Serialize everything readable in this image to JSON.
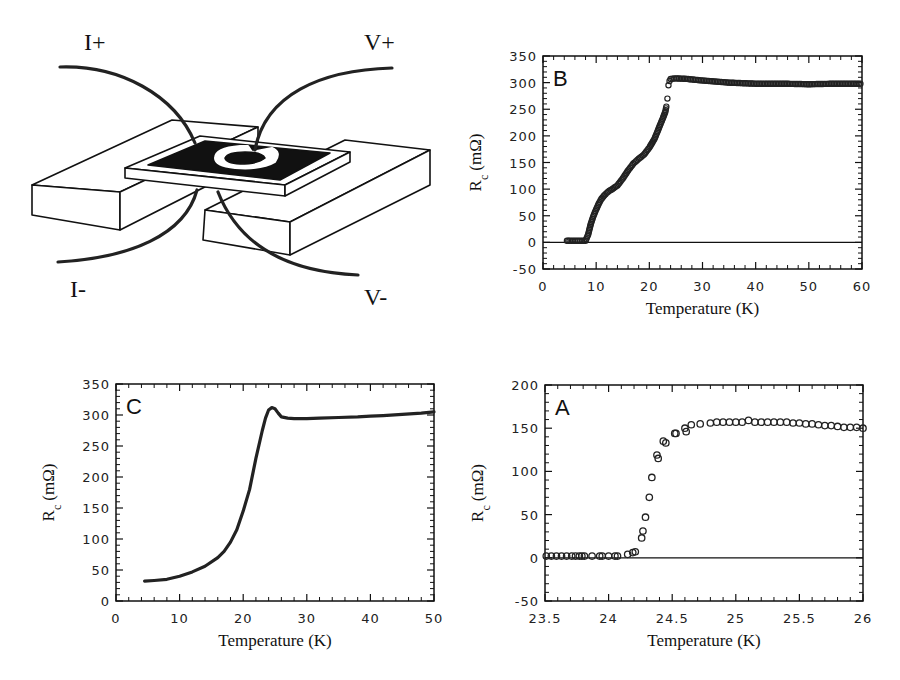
{
  "diagram": {
    "labels": {
      "i_plus": "I+",
      "v_plus": "V+",
      "i_minus": "I-",
      "v_minus": "V-"
    }
  },
  "chart_data": [
    {
      "id": "B",
      "type": "scatter",
      "panel_label": "B",
      "xlabel": "Temperature (K)",
      "ylabel": "R_c (mΩ)",
      "xlim": [
        0,
        60
      ],
      "ylim": [
        -50,
        350
      ],
      "xticks": [
        0,
        10,
        20,
        30,
        40,
        50,
        60
      ],
      "yticks": [
        -50,
        0,
        50,
        100,
        150,
        200,
        250,
        300,
        350
      ],
      "zero_line": true,
      "marker": "open-circle",
      "x": [
        4.5,
        5,
        6,
        7,
        8,
        8.5,
        9,
        9.5,
        10,
        10.5,
        11,
        11.5,
        12,
        12.5,
        13,
        14,
        15,
        16,
        17,
        18,
        19,
        20,
        21,
        22,
        22.5,
        23,
        23.2,
        23.4,
        23.6,
        23.8,
        24,
        25,
        27,
        30,
        35,
        40,
        45,
        50,
        55,
        60
      ],
      "y": [
        3,
        3,
        3,
        3,
        3,
        15,
        35,
        50,
        62,
        73,
        82,
        88,
        93,
        97,
        100,
        107,
        120,
        135,
        148,
        157,
        165,
        178,
        195,
        220,
        232,
        245,
        255,
        270,
        295,
        303,
        307,
        308,
        307,
        304,
        300,
        298,
        298,
        297,
        298,
        298
      ]
    },
    {
      "id": "C",
      "type": "line",
      "panel_label": "C",
      "xlabel": "Temperature (K)",
      "ylabel": "R_c (mΩ)",
      "xlim": [
        0,
        50
      ],
      "ylim": [
        0,
        350
      ],
      "xticks": [
        0,
        10,
        20,
        30,
        40,
        50
      ],
      "yticks": [
        0,
        50,
        100,
        150,
        200,
        250,
        300,
        350
      ],
      "zero_line": false,
      "marker": "dense-line",
      "x": [
        4.5,
        6,
        8,
        10,
        12,
        14,
        16,
        17,
        18,
        19,
        20,
        21,
        22,
        23,
        23.5,
        24,
        24.5,
        25,
        25.5,
        26,
        27,
        28,
        30,
        32,
        35,
        38,
        40,
        42,
        45,
        48,
        50
      ],
      "y": [
        32,
        33,
        35,
        40,
        47,
        56,
        70,
        80,
        95,
        115,
        145,
        180,
        230,
        275,
        295,
        308,
        312,
        310,
        303,
        297,
        295,
        294,
        294,
        295,
        296,
        297,
        298,
        299,
        301,
        303,
        305
      ]
    },
    {
      "id": "A",
      "type": "scatter",
      "panel_label": "A",
      "xlabel": "Temperature (K)",
      "ylabel": "R_c (mΩ)",
      "xlim": [
        23.5,
        26
      ],
      "ylim": [
        -50,
        200
      ],
      "xticks": [
        23.5,
        24,
        24.5,
        25,
        25.5,
        26
      ],
      "yticks": [
        -50,
        0,
        50,
        100,
        150,
        200
      ],
      "zero_line": true,
      "marker": "open-circle",
      "x": [
        23.51,
        23.55,
        23.59,
        23.63,
        23.67,
        23.71,
        23.74,
        23.77,
        23.79,
        23.81,
        23.87,
        23.93,
        23.95,
        24.0,
        24.05,
        24.07,
        24.15,
        24.19,
        24.21,
        24.26,
        24.27,
        24.29,
        24.32,
        24.34,
        24.38,
        24.39,
        24.43,
        24.45,
        24.52,
        24.53,
        24.6,
        24.61,
        24.65,
        24.72,
        24.8,
        24.85,
        24.9,
        24.95,
        25.0,
        25.05,
        25.1,
        25.15,
        25.2,
        25.25,
        25.3,
        25.35,
        25.4,
        25.45,
        25.5,
        25.55,
        25.6,
        25.65,
        25.7,
        25.75,
        25.8,
        25.85,
        25.9,
        25.95,
        26.0
      ],
      "y": [
        2,
        2,
        2,
        2,
        2,
        2,
        2,
        2,
        2,
        2,
        2,
        2,
        2,
        2,
        2,
        2,
        4,
        6,
        7,
        23,
        31,
        47,
        70,
        93,
        119,
        115,
        135,
        133,
        144,
        144,
        150,
        146,
        154,
        155,
        156,
        157,
        157,
        157,
        157,
        157,
        159,
        157,
        157,
        157,
        157,
        157,
        157,
        156,
        156,
        155,
        155,
        154,
        153,
        153,
        152,
        151,
        151,
        151,
        150
      ]
    }
  ]
}
